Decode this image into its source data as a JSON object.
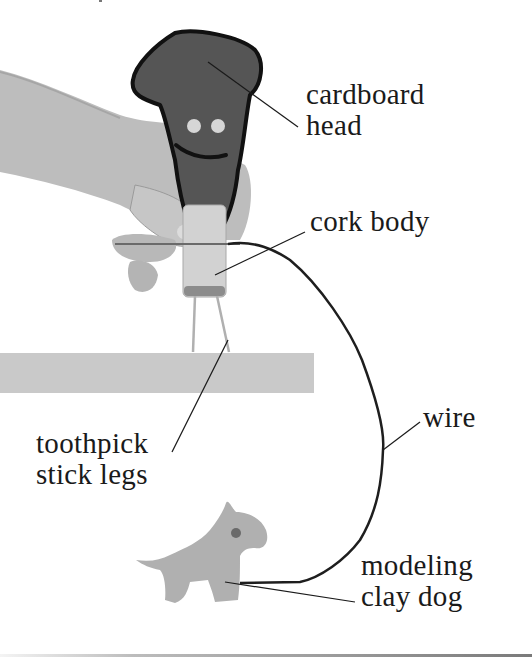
{
  "figure": {
    "colors": {
      "background": "#ffffff",
      "head_fill": "#555555",
      "head_outline": "#111111",
      "eyes": "#d6d6d6",
      "skin": "#bdbdbd",
      "cork": "#d2d2d2",
      "table_edge": "#c8c8c8",
      "dog": "#b0b0b0",
      "wire": "#1e1e1e",
      "text": "#1a1a1a"
    }
  },
  "labels": {
    "head": {
      "line1": "cardboard",
      "line2": "head"
    },
    "body": {
      "line1": "cork body"
    },
    "legs": {
      "line1": "toothpick",
      "line2": "stick legs"
    },
    "wire": {
      "line1": "wire"
    },
    "dog": {
      "line1": "modeling",
      "line2": "clay dog"
    }
  }
}
